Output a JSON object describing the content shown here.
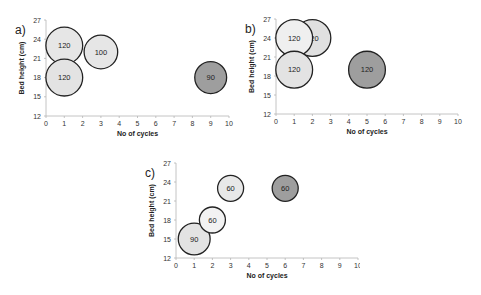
{
  "chart_data": [
    {
      "type": "scatter",
      "subtype": "bubble",
      "panel_label": "a)",
      "xlabel": "No of cycles",
      "ylabel": "Bed height (cm)",
      "xlim": [
        0,
        10
      ],
      "ylim": [
        12,
        27
      ],
      "xticks": [
        0,
        1,
        2,
        3,
        4,
        5,
        6,
        7,
        8,
        9,
        10
      ],
      "yticks": [
        12,
        15,
        18,
        21,
        24,
        27
      ],
      "grid": false,
      "points": [
        {
          "x": 1,
          "y": 23,
          "size": 120,
          "label": "120",
          "fill": "#e6e6e6"
        },
        {
          "x": 1,
          "y": 18,
          "size": 120,
          "label": "120",
          "fill": "#e3e3e3"
        },
        {
          "x": 3,
          "y": 22,
          "size": 100,
          "label": "100",
          "fill": "#e6e6e6"
        },
        {
          "x": 9,
          "y": 18,
          "size": 90,
          "label": "90",
          "fill": "#9e9e9e"
        }
      ]
    },
    {
      "type": "scatter",
      "subtype": "bubble",
      "panel_label": "b)",
      "xlabel": "No of cycles",
      "ylabel": "Bed height (cm)",
      "xlim": [
        0,
        10
      ],
      "ylim": [
        12,
        27
      ],
      "xticks": [
        0,
        1,
        2,
        3,
        4,
        5,
        6,
        7,
        8,
        9,
        10
      ],
      "yticks": [
        12,
        15,
        18,
        21,
        24,
        27
      ],
      "grid": false,
      "points": [
        {
          "x": 2,
          "y": 24,
          "size": 120,
          "label": "120",
          "fill": "#e0e0e0"
        },
        {
          "x": 1,
          "y": 24,
          "size": 120,
          "label": "120",
          "fill": "#efefef"
        },
        {
          "x": 1,
          "y": 19,
          "size": 120,
          "label": "120",
          "fill": "#e3e3e3"
        },
        {
          "x": 5,
          "y": 19,
          "size": 120,
          "label": "120",
          "fill": "#9e9e9e"
        }
      ]
    },
    {
      "type": "scatter",
      "subtype": "bubble",
      "panel_label": "c)",
      "xlabel": "No of cycles",
      "ylabel": "Bed height (cm)",
      "xlim": [
        0,
        10
      ],
      "ylim": [
        12,
        27
      ],
      "xticks": [
        0,
        1,
        2,
        3,
        4,
        5,
        6,
        7,
        8,
        9,
        10
      ],
      "yticks": [
        12,
        15,
        18,
        21,
        24,
        27
      ],
      "grid": false,
      "points": [
        {
          "x": 1,
          "y": 15,
          "size": 90,
          "label": "90",
          "fill": "#e3e3e3"
        },
        {
          "x": 2,
          "y": 18,
          "size": 60,
          "label": "60",
          "fill": "#f2f2f2"
        },
        {
          "x": 3,
          "y": 23,
          "size": 60,
          "label": "60",
          "fill": "#e8e8e8"
        },
        {
          "x": 6,
          "y": 23,
          "size": 60,
          "label": "60",
          "fill": "#9e9e9e"
        }
      ]
    }
  ],
  "colors": {
    "light_bubble": "#e6e6e6",
    "dark_bubble": "#9e9e9e",
    "bubble_stroke": "#222222",
    "axis": "#b5b5b5"
  }
}
